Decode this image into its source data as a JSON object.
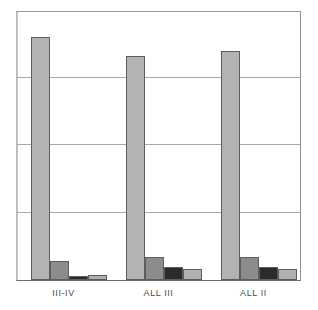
{
  "chart_data": {
    "type": "bar",
    "title": "",
    "subtitle": "",
    "xlabel": "",
    "ylabel": "",
    "ylim": [
      0,
      100
    ],
    "grid": true,
    "gridline_values": [
      25,
      50,
      75
    ],
    "legend": "none",
    "legend_position": "none",
    "axis_tick_labels_y": [],
    "categories": [
      "III-IV",
      "ALL III",
      "ALL II"
    ],
    "series": [
      {
        "name": "series-1",
        "color": "#b3b3b3",
        "values": [
          90,
          83,
          85
        ]
      },
      {
        "name": "series-2",
        "color": "#8c8c8c",
        "values": [
          7,
          8.5,
          8.5
        ]
      },
      {
        "name": "series-3",
        "color": "#2b2b2b",
        "values": [
          1.5,
          5,
          5
        ]
      },
      {
        "name": "series-4",
        "color": "#b0b0b0",
        "values": [
          2,
          4,
          4
        ]
      }
    ]
  },
  "axis": {
    "tick_labels": [
      "III-IV",
      "ALL III",
      "ALL II"
    ]
  },
  "colors": {
    "frame": "#6e6e6e",
    "gridline": "#a8a8a8",
    "bar_outline": "#5d5d5d",
    "background": "#ffffff",
    "label_text": "#4a4a4a"
  }
}
